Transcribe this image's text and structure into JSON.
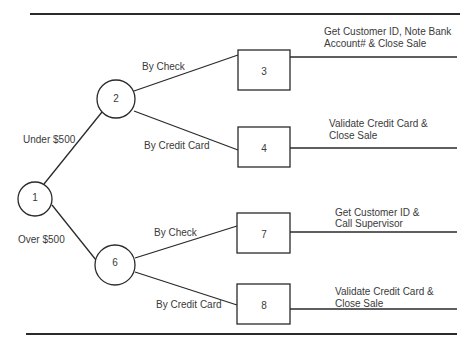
{
  "diagram": {
    "type": "decision-tree",
    "root": {
      "id": "1",
      "shape": "circle"
    },
    "branches": [
      {
        "label": "Under $500",
        "to": "2"
      },
      {
        "label": "Over $500",
        "to": "6"
      }
    ],
    "nodes": {
      "n1": "1",
      "n2": "2",
      "n6": "6",
      "n3": "3",
      "n4": "4",
      "n7": "7",
      "n8": "8"
    },
    "edge_labels": {
      "under_500": "Under $500",
      "over_500": "Over $500",
      "n2_check": "By Check",
      "n2_card": "By Credit Card",
      "n6_check": "By Check",
      "n6_card": "By Credit Card"
    },
    "outcomes": {
      "n3": {
        "line1": "Get Customer ID, Note Bank",
        "line2": "Account# & Close Sale"
      },
      "n4": {
        "line1": "Validate Credit Card &",
        "line2": "Close Sale"
      },
      "n7": {
        "line1": "Get Customer ID &",
        "line2": "Call Supervisor"
      },
      "n8": {
        "line1": "Validate Credit Card &",
        "line2": "Close Sale"
      }
    }
  }
}
